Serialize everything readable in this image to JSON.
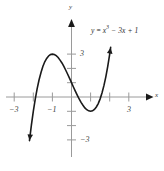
{
  "figure": {
    "background_color": "#ffffff",
    "curve_color": "#1a1a1a",
    "axis_color": "#9a9a9a",
    "label_color": "#2b2b2b",
    "equation_label": {
      "lhs": "y",
      "equals": " = ",
      "base": "x",
      "exponent": "3",
      "rest": " − 3x + 1",
      "full": "y = x³ − 3x + 1"
    },
    "axis_labels": {
      "x": "x",
      "y": "y"
    },
    "x_tick_labels": [
      "−3",
      "−1",
      "3"
    ],
    "y_tick_labels": [
      "3",
      "−3"
    ]
  },
  "chart_data": {
    "type": "line",
    "title": "",
    "subtitle": "",
    "xlabel": "x",
    "ylabel": "y",
    "equation": "y = x^3 - 3x + 1",
    "grid": false,
    "legend": false,
    "legend_position": "none",
    "annotations": [
      {
        "text": "y = x³ − 3x + 1",
        "x": 1.55,
        "y": 4.0
      }
    ],
    "xlim": [
      -4.0,
      4.6
    ],
    "ylim": [
      -4.4,
      4.6
    ],
    "xticks": [
      -3,
      -2,
      -1,
      1,
      2,
      3
    ],
    "xtick_labels": [
      "−3",
      "",
      "−1",
      "",
      "",
      "3"
    ],
    "yticks": [
      -3,
      -2,
      -1,
      1,
      2,
      3
    ],
    "ytick_labels": [
      "−3",
      "",
      "",
      "",
      "",
      "3"
    ],
    "x": [
      -2.2,
      -2.1,
      -2.0,
      -1.9,
      -1.8,
      -1.7,
      -1.6,
      -1.5,
      -1.4,
      -1.3,
      -1.2,
      -1.1,
      -1.0,
      -0.9,
      -0.8,
      -0.7,
      -0.6,
      -0.5,
      -0.4,
      -0.3,
      -0.2,
      -0.1,
      0.0,
      0.1,
      0.2,
      0.3,
      0.4,
      0.5,
      0.6,
      0.7,
      0.8,
      0.9,
      1.0,
      1.1,
      1.2,
      1.3,
      1.4,
      1.5,
      1.6,
      1.7,
      1.8,
      1.9,
      2.0,
      2.05
    ],
    "y": [
      -3.05,
      -1.96,
      -1.0,
      -0.16,
      0.57,
      1.19,
      1.7,
      2.13,
      2.46,
      2.7,
      2.87,
      2.97,
      3.0,
      2.97,
      2.89,
      2.76,
      2.58,
      2.38,
      2.14,
      1.87,
      1.59,
      1.3,
      1.0,
      0.7,
      0.41,
      0.13,
      -0.14,
      -0.38,
      -0.58,
      -0.76,
      -0.89,
      -0.97,
      -1.0,
      -0.97,
      -0.87,
      -0.7,
      -0.46,
      -0.13,
      0.3,
      0.81,
      1.43,
      2.16,
      3.0,
      3.47
    ],
    "key_points": [
      {
        "label": "local maximum",
        "x": -1,
        "y": 3
      },
      {
        "label": "local minimum",
        "x": 1,
        "y": -1
      },
      {
        "label": "y-intercept",
        "x": 0,
        "y": 1
      }
    ],
    "series": [
      {
        "name": "y = x^3 - 3x + 1",
        "color": "#1a1a1a",
        "arrow_start": true,
        "arrow_end": true
      }
    ]
  }
}
